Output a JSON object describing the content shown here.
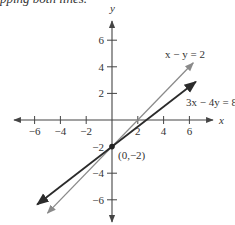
{
  "header": {
    "cut_text": "pping both lines."
  },
  "chart_data": {
    "type": "line",
    "title": "",
    "xlabel": "x",
    "ylabel": "y",
    "xlim": [
      -8,
      8
    ],
    "ylim": [
      -7.5,
      7.5
    ],
    "xticks": [
      -6,
      -4,
      -2,
      2,
      4,
      6
    ],
    "yticks": [
      6,
      4,
      2,
      -4,
      -6
    ],
    "xtick_labels": [
      "−6",
      "−4",
      "−2",
      "2",
      "4",
      "6"
    ],
    "ytick_labels": [
      "6",
      "4",
      "2",
      "−4",
      "−6"
    ],
    "grid": false,
    "series": [
      {
        "name": "x − y = 2",
        "equation": "x - y = 2",
        "color": "#8a8a8a",
        "x": [
          -5,
          6.3
        ],
        "y": [
          -7,
          4.3
        ]
      },
      {
        "name": "3x − 4y = 8",
        "equation": "3x - 4y = 8",
        "color": "#2b2b2b",
        "x": [
          -5.8,
          6.5
        ],
        "y": [
          -6.35,
          2.875
        ]
      }
    ],
    "annotations": [
      {
        "text": "(0,−2)",
        "x": 0,
        "y": -2,
        "marker": true,
        "label_ytick": "−2"
      }
    ]
  }
}
